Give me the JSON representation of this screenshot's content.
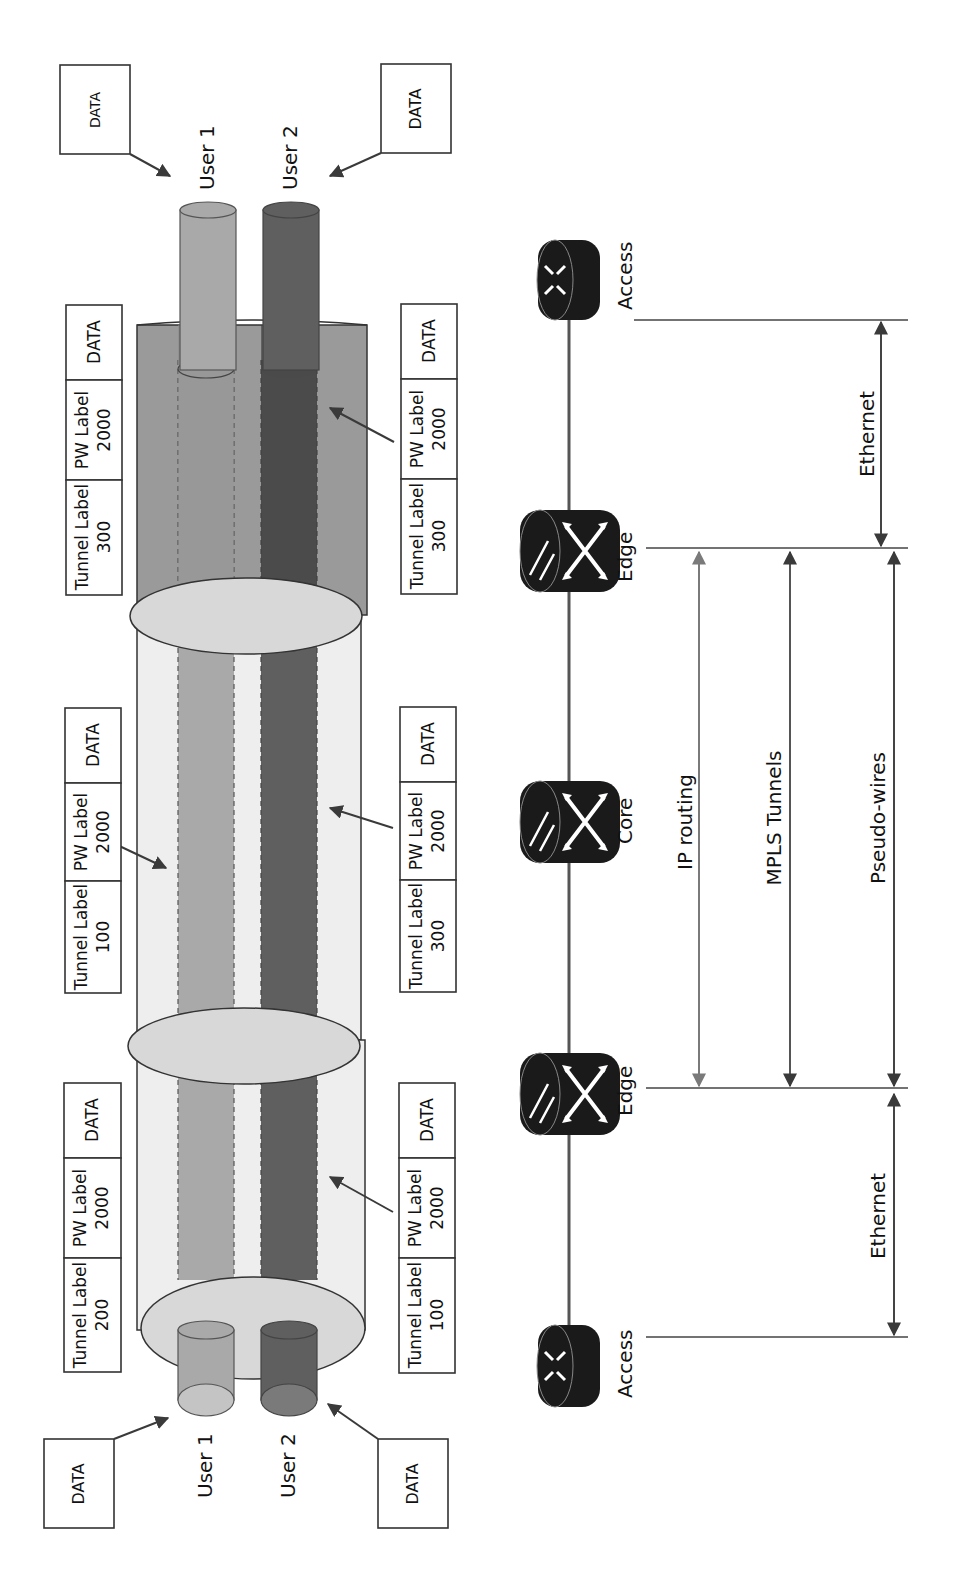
{
  "diagram": {
    "colors": {
      "user1": "#a9a9a9",
      "user2": "#5f5f5f",
      "tunnel_dark": "#9a9a9a",
      "tunnel_light": "#eeeeee",
      "ellipse": "#d8d8d8",
      "router": "#1a1a1a",
      "arrow": "#3a3a3a",
      "ip_arrow": "#7a7a7a"
    },
    "users": {
      "user1_label": "User 1",
      "user2_label": "User 2"
    },
    "data_boxes": {
      "ingress_user1": "DATA",
      "ingress_user2": "DATA",
      "egress_user1": "DATA",
      "egress_user2": "DATA"
    },
    "label_stacks": [
      {
        "id": "seg1-user1",
        "position": "left-bottom",
        "tunnel_label": "Tunnel Label",
        "tunnel_value": "200",
        "pw_label": "PW Label",
        "pw_value": "2000",
        "data": "DATA"
      },
      {
        "id": "seg1-user2",
        "position": "right-bottom",
        "tunnel_label": "Tunnel Label",
        "tunnel_value": "100",
        "pw_label": "PW Label",
        "pw_value": "2000",
        "data": "DATA"
      },
      {
        "id": "seg2-user1",
        "position": "left-middle",
        "tunnel_label": "Tunnel Label",
        "tunnel_value": "100",
        "pw_label": "PW Label",
        "pw_value": "2000",
        "data": "DATA"
      },
      {
        "id": "seg2-user2",
        "position": "right-middle",
        "tunnel_label": "Tunnel Label",
        "tunnel_value": "300",
        "pw_label": "PW Label",
        "pw_value": "2000",
        "data": "DATA"
      },
      {
        "id": "seg3-user1",
        "position": "left-top",
        "tunnel_label": "Tunnel Label",
        "tunnel_value": "300",
        "pw_label": "PW Label",
        "pw_value": "2000",
        "data": "DATA"
      },
      {
        "id": "seg3-user2",
        "position": "right-top",
        "tunnel_label": "Tunnel Label",
        "tunnel_value": "300",
        "pw_label": "PW Label",
        "pw_value": "2000",
        "data": "DATA"
      }
    ],
    "routers": [
      {
        "name": "Access",
        "type": "access"
      },
      {
        "name": "Edge",
        "type": "edge"
      },
      {
        "name": "Core",
        "type": "core"
      },
      {
        "name": "Edge",
        "type": "edge"
      },
      {
        "name": "Access",
        "type": "access"
      }
    ],
    "spans": {
      "ethernet_ingress": "Ethernet",
      "ip_routing": "IP routing",
      "mpls_tunnels": "MPLS Tunnels",
      "pseudo_wires": "Pseudo-wires",
      "ethernet_egress": "Ethernet"
    }
  }
}
